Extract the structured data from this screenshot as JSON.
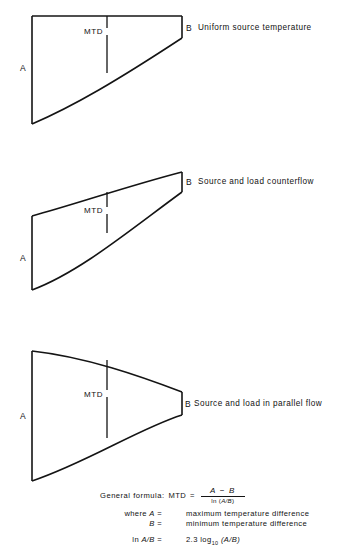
{
  "figure": {
    "panels": [
      {
        "id": "uniform-source",
        "caption": "Uniform source temperature",
        "left_label": "A",
        "right_label": "B",
        "mtd_label": "MTD"
      },
      {
        "id": "counterflow",
        "caption": "Source and load counterflow",
        "left_label": "A",
        "right_label": "B",
        "mtd_label": "MTD"
      },
      {
        "id": "parallel-flow",
        "caption": "Source and load in parallel flow",
        "left_label": "A",
        "right_label": "B",
        "mtd_label": "MTD"
      }
    ]
  },
  "formula": {
    "general_label": "General formula:",
    "term": "MTD",
    "equals": "=",
    "numerator": "A − B",
    "denominator_prefix": "ln (",
    "denominator_body": "A/B",
    "denominator_suffix": ")",
    "where_label": "where",
    "definitions": [
      {
        "symbol": "A",
        "equals": "=",
        "text": "maximum temperature difference"
      },
      {
        "symbol": "B",
        "equals": "=",
        "text": "minimum temperature difference"
      }
    ],
    "ln_identity": {
      "lhs_prefix": "ln",
      "lhs_symbol": "A/B",
      "equals": "=",
      "coefficient": "2.3",
      "log_base": "log",
      "log_subscript": "10",
      "log_arg": "(A/B)"
    }
  },
  "colors": {
    "ink": "#141414",
    "paper": "#ffffff"
  }
}
